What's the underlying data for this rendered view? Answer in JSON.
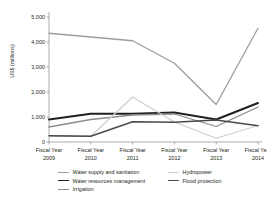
{
  "chart_data": {
    "type": "line",
    "title": "",
    "xlabel": "",
    "ylabel": "US$ (millions)",
    "categories": [
      "Fiscal Year 2009",
      "Fiscal Year 2010",
      "Fiscal Year 2011",
      "Fiscal Year 2012",
      "Fiscal Year 2013",
      "Fiscal Year 2014"
    ],
    "x_tick_prefix": "Fiscal Year",
    "x_tick_years": [
      "2009",
      "2010",
      "2011",
      "2012",
      "2013",
      "2014"
    ],
    "y_ticks": [
      0,
      1000,
      2000,
      3000,
      4000,
      5000
    ],
    "y_tick_labels": [
      "0",
      "1,000",
      "2,000",
      "3,000",
      "4,000",
      "5,000"
    ],
    "ylim": [
      0,
      5000
    ],
    "grid": false,
    "legend_position": "bottom",
    "series": [
      {
        "name": "Water supply and sanitation",
        "color": "#9d9d9d",
        "width": 1.3,
        "values": [
          4350,
          4200,
          4050,
          3150,
          1500,
          4550
        ]
      },
      {
        "name": "Water resources management",
        "color": "#231f20",
        "width": 1.9,
        "values": [
          900,
          1130,
          1130,
          1180,
          900,
          1560
        ]
      },
      {
        "name": "Irrigation",
        "color": "#8c8c8c",
        "width": 1.3,
        "values": [
          600,
          900,
          1080,
          1120,
          620,
          1400
        ]
      },
      {
        "name": "Hydropower",
        "color": "#cfcfcf",
        "width": 1.3,
        "values": [
          240,
          230,
          1800,
          800,
          150,
          660
        ]
      },
      {
        "name": "Flood protection",
        "color": "#4a4a4a",
        "width": 1.5,
        "values": [
          250,
          230,
          810,
          790,
          880,
          650
        ]
      }
    ]
  },
  "legend": {
    "left_items": [
      "Water supply and sanitation",
      "Water resources management",
      "Irrigation"
    ],
    "right_items": [
      "Hydropower",
      "Flood protection"
    ]
  }
}
